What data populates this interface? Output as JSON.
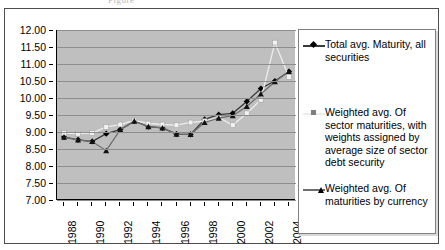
{
  "top_fragment": "Figure",
  "chart_data": {
    "type": "line",
    "title": "",
    "xlabel": "",
    "ylabel": "",
    "x": [
      1988,
      1989,
      1990,
      1991,
      1992,
      1993,
      1994,
      1995,
      1996,
      1997,
      1998,
      1999,
      2000,
      2001,
      2002,
      2003,
      2004
    ],
    "xtick_labels": [
      "1988",
      "",
      "1990",
      "",
      "1992",
      "",
      "1994",
      "",
      "1996",
      "",
      "1998",
      "",
      "2000",
      "",
      "2002",
      "",
      "2004"
    ],
    "xtick_labels_shown": [
      "1988",
      "1990",
      "1992",
      "1994",
      "1996",
      "1998",
      "2000",
      "2002",
      "2004"
    ],
    "ylim": [
      7.0,
      12.0
    ],
    "ytick_labels": [
      "12.00",
      "11.50",
      "11.00",
      "10.50",
      "10.00",
      "9.50",
      "9.00",
      "8.50",
      "8.00",
      "7.50",
      "7.00"
    ],
    "ytick_values": [
      12.0,
      11.5,
      11.0,
      10.5,
      10.0,
      9.5,
      9.0,
      8.5,
      8.0,
      7.5,
      7.0
    ],
    "grid": true,
    "legend_position": "right",
    "plot_background": "#bfbfbf",
    "series": [
      {
        "name": "Total avg. Maturity, all securities",
        "marker": "diamond",
        "color": "#000000",
        "line_color": "#3a3a3a",
        "values": [
          8.85,
          8.77,
          8.72,
          8.95,
          9.07,
          9.32,
          9.16,
          9.12,
          8.94,
          8.93,
          9.37,
          9.51,
          9.55,
          9.9,
          10.28,
          10.5,
          10.78
        ]
      },
      {
        "name": "Weighted avg. Of sector maturities, with weights assigned by average size of sector debt security",
        "marker": "square",
        "color": "#f2f2f2",
        "line_color": "#ededed",
        "values": [
          8.97,
          8.95,
          8.97,
          9.15,
          9.22,
          9.34,
          9.25,
          9.22,
          9.2,
          9.28,
          9.32,
          9.43,
          9.2,
          9.55,
          9.95,
          11.63,
          10.62
        ]
      },
      {
        "name": "Weighted avg. Of maturities by currency",
        "marker": "triangle",
        "color": "#111111",
        "line_color": "#6e6e6e",
        "values": [
          8.85,
          8.77,
          8.72,
          8.45,
          9.07,
          9.32,
          9.16,
          9.12,
          8.94,
          8.93,
          9.28,
          9.41,
          9.48,
          9.75,
          10.12,
          10.48,
          10.78
        ]
      }
    ]
  },
  "legend": {
    "entries": [
      {
        "label": "Total avg. Maturity, all securities",
        "marker": "diamond"
      },
      {
        "label": "Weighted avg. Of sector maturities, with weights assigned by average size of sector debt security",
        "marker": "square"
      },
      {
        "label": "Weighted avg. Of maturities by currency",
        "marker": "triangle"
      }
    ]
  }
}
